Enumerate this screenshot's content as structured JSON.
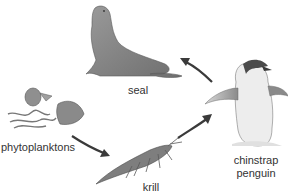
{
  "diagram": {
    "type": "food-chain",
    "nodes": [
      {
        "id": "phytoplanktons",
        "label": "phytoplanktons"
      },
      {
        "id": "krill",
        "label": "krill"
      },
      {
        "id": "penguin",
        "label_line1": "chinstrap",
        "label_line2": "penguin"
      },
      {
        "id": "seal",
        "label": "seal"
      }
    ],
    "edges": [
      {
        "from": "phytoplanktons",
        "to": "krill"
      },
      {
        "from": "krill",
        "to": "penguin"
      },
      {
        "from": "penguin",
        "to": "seal"
      }
    ]
  },
  "colors": {
    "arrow": "#3a3a3a",
    "animal": "#8a8a8a",
    "text": "#333333"
  }
}
